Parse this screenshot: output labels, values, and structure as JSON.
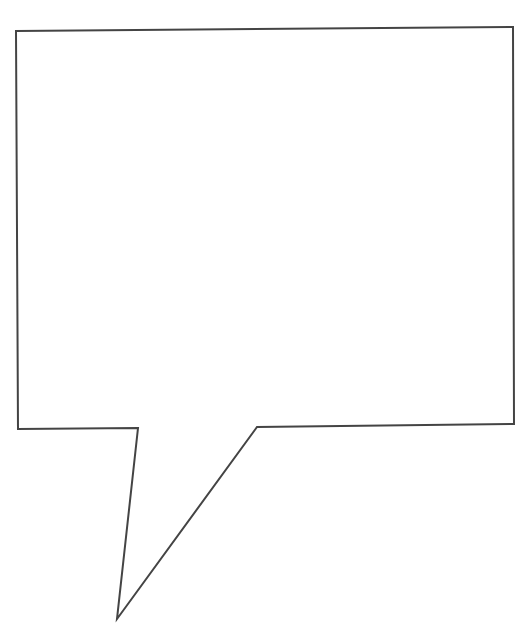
{
  "diagram": {
    "type": "speech-bubble",
    "background": "#ffffff",
    "stroke_color": "#444444",
    "fill_color": "#ffffff",
    "stroke_width": 2,
    "text": ""
  }
}
